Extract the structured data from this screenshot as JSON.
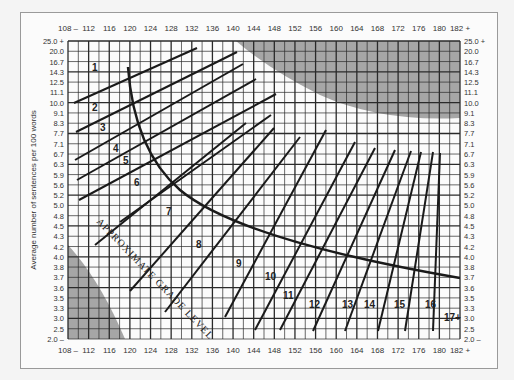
{
  "chart_data": {
    "type": "line",
    "xlabel": "Average number of syllables per 100 words",
    "ylabel": "Average number of sentences per 100 words",
    "x_ticks": [
      "108 –",
      "112",
      "116",
      "120",
      "124",
      "128",
      "132",
      "136",
      "140",
      "144",
      "148",
      "152",
      "156",
      "160",
      "164",
      "168",
      "172",
      "176",
      "180",
      "182 +"
    ],
    "y_ticks": [
      "25.0 +",
      "20.0",
      "16.7",
      "14.3",
      "12.5",
      "11.1",
      "10.0",
      "9.1",
      "8.3",
      "7.7",
      "7.1",
      "6.7",
      "6.3",
      "5.9",
      "5.6",
      "5.2",
      "5.0",
      "4.8",
      "4.5",
      "4.3",
      "4.2",
      "4.0",
      "3.8",
      "3.7",
      "3.6",
      "3.5",
      "3.3",
      "3.0",
      "2.5",
      "2.0 –"
    ],
    "grade_labels": [
      "1",
      "2",
      "3",
      "4",
      "5",
      "6",
      "7",
      "8",
      "9",
      "10",
      "11",
      "12",
      "13",
      "14",
      "15",
      "16",
      "17+"
    ],
    "curve_annotation": "APPROXIMATE GRADE LEVEL",
    "shaded_regions": [
      "upper-right invalid zone",
      "lower-left invalid zone"
    ],
    "grid": true,
    "xlim": [
      108,
      182
    ],
    "ylim": [
      2.0,
      25.0
    ]
  },
  "colors": {
    "grid": "#2a2a2a",
    "shade": "#a6a6a6",
    "line": "#1a1a1a",
    "background": "#fbfbfb"
  }
}
